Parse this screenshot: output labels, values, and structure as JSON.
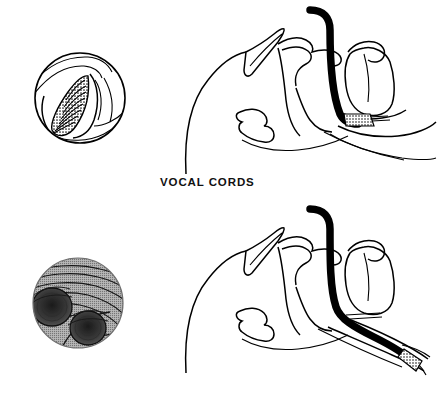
{
  "figure": {
    "background_color": "#ffffff",
    "ink_color": "#000000",
    "halftone_gray": "#9a9a9a",
    "shadow_gray": "#4a4a4a"
  },
  "panels": [
    {
      "id": "vocal-cords",
      "caption": "VOCAL CORDS",
      "inset": {
        "view_name": "vocal-cords-endoscopic-view",
        "description": "Circular bronchoscopic view of the glottis: V-shaped glottic opening bordered by vocal cords, with stacked hatched tracheal rings visible below",
        "shape": "circle",
        "features": [
          "glottic-opening",
          "vocal-cord-left",
          "vocal-cord-right",
          "tracheal-rings",
          "epiglottis-edge",
          "aryepiglottic-fold"
        ]
      },
      "airway": {
        "view_name": "sagittal-head-airway-diagram",
        "description": "Midsagittal line drawing of the head and upper airway with endotracheal tube advanced to the level of the larynx",
        "tube_tip_location": "larynx",
        "features": [
          "forehead-profile",
          "nose",
          "hard-palate",
          "soft-palate",
          "tongue",
          "mandible",
          "epiglottis",
          "larynx",
          "trachea",
          "esophagus",
          "endotracheal-tube"
        ]
      }
    },
    {
      "id": "carina",
      "caption": "CARINA",
      "inset": {
        "view_name": "carina-endoscopic-view",
        "description": "Circular bronchoscopic view of the carina: two dark bronchial orifices on a gray halftone mucosal field with curved cartilage ridge lines",
        "shape": "circle",
        "features": [
          "carinal-ridge",
          "right-main-bronchus-orifice",
          "left-main-bronchus-orifice",
          "tracheal-ring-ridges",
          "mucosal-shading"
        ]
      },
      "airway": {
        "view_name": "sagittal-head-airway-diagram",
        "description": "Midsagittal line drawing of the head and upper airway with endotracheal tube advanced down the trachea to the tracheal bifurcation",
        "tube_tip_location": "tracheal-bifurcation",
        "features": [
          "forehead-profile",
          "nose",
          "hard-palate",
          "soft-palate",
          "tongue",
          "mandible",
          "epiglottis",
          "larynx",
          "trachea",
          "main-bronchi",
          "endotracheal-tube"
        ]
      }
    }
  ]
}
